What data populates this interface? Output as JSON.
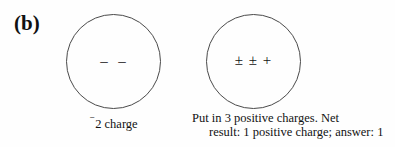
{
  "figure": {
    "panel_label": "(b)",
    "background_color": "#fefefe",
    "stroke_color": "#4a4a4a",
    "text_color": "#121212"
  },
  "diagram_data": {
    "type": "diagram",
    "subject": "net-charge-illustration",
    "panels": [
      {
        "id": "before",
        "shape": "circle",
        "symbols": "–  –",
        "symbol_meaning": "two negative charges",
        "caption_prefix": "⁻",
        "caption": "2 charge",
        "caption_full": "⁻2 charge",
        "net_charge": -2
      },
      {
        "id": "after",
        "shape": "circle",
        "symbols": "± ± +",
        "symbol_meaning": "two cancelled pairs plus one remaining positive charge",
        "caption_line_1": "Put in 3 positive charges. Net",
        "caption_line_2": "result: 1 positive charge; answer: 1",
        "net_charge": 1,
        "positive_charges_added": 3
      }
    ]
  }
}
